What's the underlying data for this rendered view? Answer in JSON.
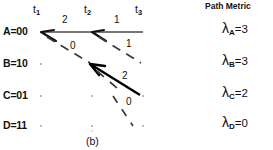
{
  "caption": "(b)",
  "colors": {
    "ink": "#111111",
    "line": "#4a4a4a",
    "bold_line": "#000000",
    "node": "#9a9a9a"
  },
  "time_axis": {
    "label": "t",
    "ticks": [
      {
        "name": "t1",
        "sub": "1",
        "x": 41
      },
      {
        "name": "t2",
        "sub": "2",
        "x": 92
      },
      {
        "name": "t3",
        "sub": "3",
        "x": 143
      }
    ]
  },
  "states": [
    {
      "id": "A",
      "label": "A=00",
      "bits": "00",
      "y": 32
    },
    {
      "id": "B",
      "label": "B=10",
      "bits": "10",
      "y": 64
    },
    {
      "id": "C",
      "label": "C=01",
      "bits": "01",
      "y": 96
    },
    {
      "id": "D",
      "label": "D=11",
      "bits": "11",
      "y": 126
    }
  ],
  "branch_labels": [
    {
      "text": "2",
      "x": 62,
      "y": 24
    },
    {
      "text": "1",
      "x": 114,
      "y": 24
    },
    {
      "text": "0",
      "x": 70,
      "y": 48
    },
    {
      "text": "1",
      "x": 125,
      "y": 46
    },
    {
      "text": "2",
      "x": 122,
      "y": 78
    },
    {
      "text": "0",
      "x": 124,
      "y": 104
    }
  ],
  "path_metric": {
    "header": "Path Metric",
    "symbol": "λ",
    "rows": [
      {
        "state": "A",
        "sub": "A",
        "eq": "=3",
        "value": 3,
        "y": 28
      },
      {
        "state": "B",
        "sub": "B",
        "eq": "=3",
        "value": 3,
        "y": 60
      },
      {
        "state": "C",
        "sub": "C",
        "eq": "=2",
        "value": 2,
        "y": 92
      },
      {
        "state": "D",
        "sub": "D",
        "eq": "=0",
        "value": 0,
        "y": 122
      }
    ]
  }
}
